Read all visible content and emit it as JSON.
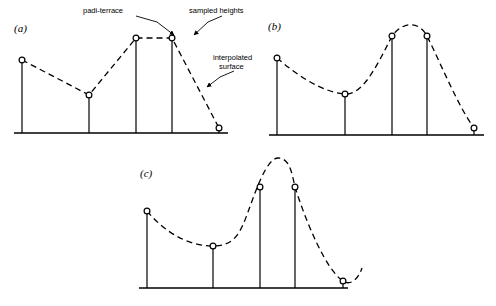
{
  "figure": {
    "background_color": "#ffffff",
    "line_color": "#000000",
    "marker_fill": "#ffffff",
    "marker_stroke": "#000000"
  },
  "annotations": [
    {
      "id": "padi-terrace",
      "text": "padi-terrace",
      "text_x": 83,
      "text_y": 13,
      "leader": [
        [
          136,
          16
        ],
        [
          157,
          22
        ],
        [
          176,
          36
        ]
      ],
      "arrow_at": [
        176,
        36
      ],
      "arrow_angle": 36
    },
    {
      "id": "sampled-heights",
      "text": "sampled heights",
      "text_x": 189,
      "text_y": 13,
      "leader": [
        [
          222,
          16
        ],
        [
          208,
          22
        ],
        [
          192,
          36
        ]
      ],
      "arrow_at": [
        192,
        36
      ],
      "arrow_angle": 218
    },
    {
      "id": "interpolated-surface",
      "text_line1": "interpolated",
      "text_line2": "surface",
      "text_x": 213,
      "text_y": 60,
      "leader": [
        [
          234,
          71
        ],
        [
          220,
          77
        ],
        [
          205,
          88
        ]
      ],
      "arrow_at": [
        205,
        88
      ],
      "arrow_angle": 216
    }
  ],
  "panels": [
    {
      "id": "a",
      "label": "(a)",
      "label_x": 14,
      "label_y": 32,
      "interpolation": "linear",
      "axis": {
        "x0": 14,
        "x1": 228,
        "y": 133
      },
      "points": [
        {
          "x": 22,
          "y": 60
        },
        {
          "x": 89,
          "y": 95
        },
        {
          "x": 136,
          "y": 38
        },
        {
          "x": 172,
          "y": 38
        },
        {
          "x": 219,
          "y": 128
        }
      ],
      "curve": "M22,60 L89,95 L136,38 L172,38 L219,128"
    },
    {
      "id": "b",
      "label": "(b)",
      "label_x": 268,
      "label_y": 30,
      "interpolation": "smooth-spline",
      "axis": {
        "x0": 269,
        "x1": 484,
        "y": 135
      },
      "points": [
        {
          "x": 277,
          "y": 58
        },
        {
          "x": 345,
          "y": 94
        },
        {
          "x": 392,
          "y": 36
        },
        {
          "x": 427,
          "y": 36
        },
        {
          "x": 474,
          "y": 128
        }
      ],
      "curve": "M277,58 C298,76 322,92 345,94 C362,95 375,70 392,36 C404,20 420,22 427,36 C441,64 458,106 474,128"
    },
    {
      "id": "c",
      "label": "(c)",
      "label_x": 140,
      "label_y": 177,
      "interpolation": "overshooting-spline",
      "axis": {
        "x0": 139,
        "x1": 348,
        "y": 288
      },
      "points": [
        {
          "x": 147,
          "y": 211
        },
        {
          "x": 213,
          "y": 246
        },
        {
          "x": 260,
          "y": 187
        },
        {
          "x": 295,
          "y": 187
        },
        {
          "x": 343,
          "y": 281
        }
      ],
      "curve": "M147,211 C168,236 192,246 213,246 C234,246 240,234 248,212 C254,196 266,158 278,158 C290,158 292,174 295,187 C306,222 326,270 343,281 C350,286 358,280 362,268",
      "overshoot_peak": {
        "x": 278,
        "y": 158
      }
    }
  ]
}
